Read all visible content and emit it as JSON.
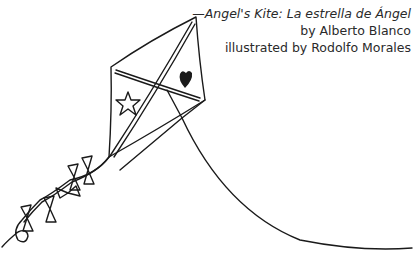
{
  "caption": {
    "title_prefix": "—",
    "title": "Angel's Kite: La estrella de Ángel",
    "author_line": "by Alberto Blanco",
    "illustrator_line": "illustrated by Rodolfo Morales"
  },
  "illustration": {
    "subject": "kite-drawing",
    "elements": [
      "kite-body",
      "kite-crossbars",
      "star-icon",
      "heart-icon",
      "kite-string",
      "kite-tail-bows"
    ],
    "stroke_color": "#1a1a1a",
    "background_color": "#ffffff"
  }
}
